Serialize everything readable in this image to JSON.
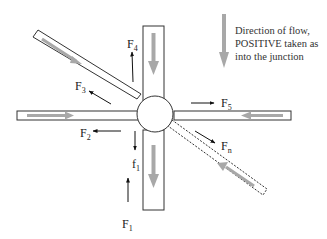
{
  "legend": {
    "line1": "Direction of  flow,",
    "line2": "POSITIVE taken as",
    "line3": "into the junction",
    "arrow_color": "#a8a8a8"
  },
  "labels": {
    "F1": {
      "main": "F",
      "sub": "1"
    },
    "f1": {
      "main": "f",
      "sub": "1"
    },
    "F2": {
      "main": "F",
      "sub": "2"
    },
    "F3": {
      "main": "F",
      "sub": "3"
    },
    "F4": {
      "main": "F",
      "sub": "4"
    },
    "F5": {
      "main": "F",
      "sub": "5"
    },
    "Fn": {
      "main": "F",
      "sub": "n"
    }
  },
  "colors": {
    "outline": "#333333",
    "flow_arrow": "#a8a8a8",
    "force_arrow": "#111111"
  }
}
